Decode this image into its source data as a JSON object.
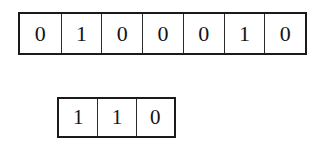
{
  "figure": {
    "background_color": "#ffffff",
    "border_color": "#1a1a1a",
    "divider_color": "#2a2a2a",
    "text_color": "#141414"
  },
  "rows": [
    {
      "name": "top-row",
      "cell_count": 7,
      "cells": [
        "0",
        "1",
        "0",
        "0",
        "0",
        "1",
        "0"
      ],
      "sequence": "0100010"
    },
    {
      "name": "bottom-row",
      "cell_count": 3,
      "cells": [
        "1",
        "1",
        "0"
      ],
      "sequence": "110"
    }
  ]
}
